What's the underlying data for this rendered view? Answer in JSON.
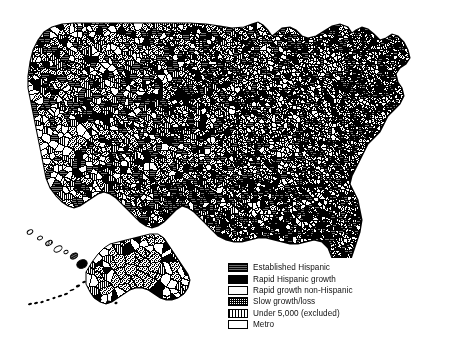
{
  "figure": {
    "title": "",
    "background_color": "#ffffff",
    "width": 456,
    "height": 340
  },
  "map": {
    "name": "united-states-counties-choropleth",
    "projection": "albers-usa",
    "insets": [
      "Alaska",
      "Hawaii"
    ],
    "border_color": "#000000",
    "background_color": "#ffffff"
  },
  "legend": {
    "position": "bottom-center",
    "bordered": false,
    "items": [
      {
        "label": "Established Hispanic",
        "pattern": "dark-horizontal-hatch",
        "color": "#2b2b2b"
      },
      {
        "label": "Rapid Hispanic  growth",
        "pattern": "solid-black",
        "color": "#000000"
      },
      {
        "label": "Rapid  growth non-Hispanic",
        "pattern": "white",
        "color": "#fdfdfd"
      },
      {
        "label": "Slow  growth/loss",
        "pattern": "dense-stipple",
        "color": "#808080"
      },
      {
        "label": "Under 5,000 (excluded)",
        "pattern": "vertical-line-grid",
        "color": "#a0a0a0"
      },
      {
        "label": "Metro",
        "pattern": "white-plain",
        "color": "#ffffff"
      }
    ]
  },
  "chart_data": {
    "type": "map",
    "title": "",
    "xlabel": "",
    "ylabel": "",
    "categories": [
      "Established Hispanic",
      "Rapid Hispanic  growth",
      "Rapid  growth non-Hispanic",
      "Slow  growth/loss",
      "Under 5,000 (excluded)",
      "Metro"
    ],
    "legend_position": "bottom-center",
    "grid": false,
    "regions": [
      {
        "name": "Pacific Northwest",
        "dominant": "Slow  growth/loss"
      },
      {
        "name": "California",
        "dominant": "Metro"
      },
      {
        "name": "Mountain West",
        "dominant": "Under 5,000 (excluded)"
      },
      {
        "name": "Great Plains",
        "dominant": "Slow  growth/loss"
      },
      {
        "name": "Texas",
        "dominant": "Established Hispanic"
      },
      {
        "name": "Midwest",
        "dominant": "Slow  growth/loss"
      },
      {
        "name": "Southeast",
        "dominant": "Rapid Hispanic  growth"
      },
      {
        "name": "Northeast",
        "dominant": "Slow  growth/loss"
      },
      {
        "name": "Florida",
        "dominant": "Rapid Hispanic  growth"
      },
      {
        "name": "Alaska",
        "dominant": "Slow  growth/loss"
      },
      {
        "name": "Hawaii",
        "dominant": "Rapid Hispanic  growth"
      }
    ]
  }
}
